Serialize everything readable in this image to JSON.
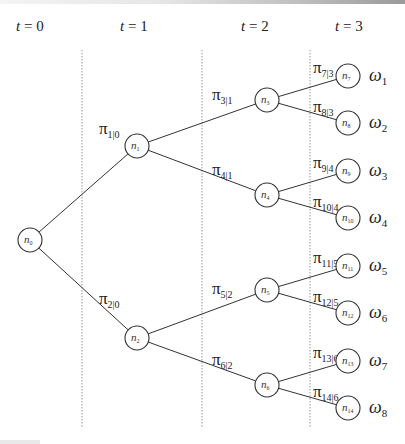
{
  "time_labels": [
    {
      "var": "t",
      "eq": " = 0",
      "x": 16
    },
    {
      "var": "t",
      "eq": " = 1",
      "x": 120
    },
    {
      "var": "t",
      "eq": " = 2",
      "x": 241
    },
    {
      "var": "t",
      "eq": " = 3",
      "x": 335
    }
  ],
  "dividers_x": [
    82,
    202,
    310
  ],
  "nodes": [
    {
      "id": "n0",
      "label": "n",
      "sub": "0",
      "cx": 30,
      "cy": 240
    },
    {
      "id": "n1",
      "label": "n",
      "sub": "1",
      "cx": 137,
      "cy": 146
    },
    {
      "id": "n2",
      "label": "n",
      "sub": "2",
      "cx": 137,
      "cy": 338
    },
    {
      "id": "n3",
      "label": "n",
      "sub": "3",
      "cx": 267,
      "cy": 100
    },
    {
      "id": "n4",
      "label": "n",
      "sub": "4",
      "cx": 267,
      "cy": 195
    },
    {
      "id": "n5",
      "label": "n",
      "sub": "5",
      "cx": 267,
      "cy": 290
    },
    {
      "id": "n6",
      "label": "n",
      "sub": "6",
      "cx": 267,
      "cy": 385
    },
    {
      "id": "n7",
      "label": "n",
      "sub": "7",
      "cx": 348,
      "cy": 76
    },
    {
      "id": "n8",
      "label": "n",
      "sub": "8",
      "cx": 348,
      "cy": 123
    },
    {
      "id": "n9",
      "label": "n",
      "sub": "9",
      "cx": 348,
      "cy": 171
    },
    {
      "id": "n10",
      "label": "n",
      "sub": "10",
      "cx": 348,
      "cy": 218
    },
    {
      "id": "n11",
      "label": "n",
      "sub": "11",
      "cx": 348,
      "cy": 266
    },
    {
      "id": "n12",
      "label": "n",
      "sub": "12",
      "cx": 348,
      "cy": 313
    },
    {
      "id": "n13",
      "label": "n",
      "sub": "13",
      "cx": 348,
      "cy": 361
    },
    {
      "id": "n14",
      "label": "n",
      "sub": "14",
      "cx": 348,
      "cy": 408
    }
  ],
  "edges": [
    {
      "from": "n0",
      "to": "n1",
      "label": "π",
      "sub": "1|0",
      "lx": 99,
      "ly": 134
    },
    {
      "from": "n0",
      "to": "n2",
      "label": "π",
      "sub": "2|0",
      "lx": 99,
      "ly": 304
    },
    {
      "from": "n1",
      "to": "n3",
      "label": "π",
      "sub": "3|1",
      "lx": 212,
      "ly": 100
    },
    {
      "from": "n1",
      "to": "n4",
      "label": "π",
      "sub": "4|1",
      "lx": 212,
      "ly": 175
    },
    {
      "from": "n2",
      "to": "n5",
      "label": "π",
      "sub": "5|2",
      "lx": 212,
      "ly": 294
    },
    {
      "from": "n2",
      "to": "n6",
      "label": "π",
      "sub": "6|2",
      "lx": 212,
      "ly": 365
    },
    {
      "from": "n3",
      "to": "n7",
      "label": "π",
      "sub": "7|3",
      "lx": 313,
      "ly": 73
    },
    {
      "from": "n3",
      "to": "n8",
      "label": "π",
      "sub": "8|3",
      "lx": 313,
      "ly": 112
    },
    {
      "from": "n4",
      "to": "n9",
      "label": "π",
      "sub": "9|4",
      "lx": 313,
      "ly": 168
    },
    {
      "from": "n4",
      "to": "n10",
      "label": "π",
      "sub": "10|4",
      "lx": 313,
      "ly": 207
    },
    {
      "from": "n5",
      "to": "n11",
      "label": "π",
      "sub": "11|5",
      "lx": 313,
      "ly": 263
    },
    {
      "from": "n5",
      "to": "n12",
      "label": "π",
      "sub": "12|5",
      "lx": 313,
      "ly": 302
    },
    {
      "from": "n6",
      "to": "n13",
      "label": "π",
      "sub": "13|6",
      "lx": 313,
      "ly": 358
    },
    {
      "from": "n6",
      "to": "n14",
      "label": "π",
      "sub": "14|6",
      "lx": 313,
      "ly": 397
    }
  ],
  "outcomes": [
    {
      "label": "ω",
      "sub": "1",
      "node": "n7"
    },
    {
      "label": "ω",
      "sub": "2",
      "node": "n8"
    },
    {
      "label": "ω",
      "sub": "3",
      "node": "n9"
    },
    {
      "label": "ω",
      "sub": "4",
      "node": "n10"
    },
    {
      "label": "ω",
      "sub": "5",
      "node": "n11"
    },
    {
      "label": "ω",
      "sub": "6",
      "node": "n12"
    },
    {
      "label": "ω",
      "sub": "7",
      "node": "n13"
    },
    {
      "label": "ω",
      "sub": "8",
      "node": "n14"
    }
  ]
}
